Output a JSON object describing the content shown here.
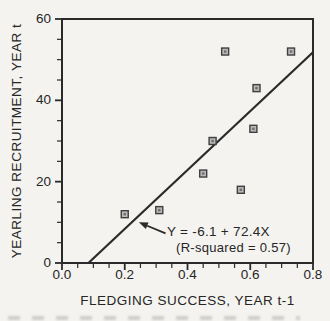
{
  "figure": {
    "background": "#f4f3ef"
  },
  "chart_data": {
    "type": "scatter",
    "xlabel": "FLEDGING SUCCESS, YEAR t-1",
    "ylabel": "YEARLING RECRUITMENT, YEAR t",
    "xlim": [
      0,
      0.8
    ],
    "ylim": [
      0,
      60
    ],
    "x_major_ticks": [
      "0.0",
      "0.2",
      "0.4",
      "0.6",
      "0.8"
    ],
    "y_major_ticks": [
      "0",
      "20",
      "40",
      "60"
    ],
    "x_minor_step": 0.05,
    "y_minor_step": 5,
    "grid": "off",
    "legend": "none",
    "points": [
      {
        "x": 0.2,
        "y": 12
      },
      {
        "x": 0.31,
        "y": 13
      },
      {
        "x": 0.45,
        "y": 22
      },
      {
        "x": 0.48,
        "y": 30
      },
      {
        "x": 0.52,
        "y": 52
      },
      {
        "x": 0.57,
        "y": 18
      },
      {
        "x": 0.61,
        "y": 33
      },
      {
        "x": 0.62,
        "y": 43
      },
      {
        "x": 0.73,
        "y": 52
      }
    ],
    "regression": {
      "intercept": -6.1,
      "slope": 72.4,
      "x_end": 0.8
    },
    "annotation": {
      "line1": "Y = -6.1 + 72.4X",
      "line2": "(R-squared = 0.57)",
      "arrow_from": {
        "x": 0.33,
        "y": 7.3
      },
      "arrow_to": {
        "x": 0.245,
        "y": 10.0
      }
    },
    "marker": {
      "shape": "square",
      "size": 7
    },
    "colors": {
      "ink": "#2a2a2a",
      "marker_fill": "#b8b8b8",
      "marker_edge": "#3f3f3f",
      "marker_center": "#6e6e6e",
      "background": "#f4f3ef"
    }
  }
}
